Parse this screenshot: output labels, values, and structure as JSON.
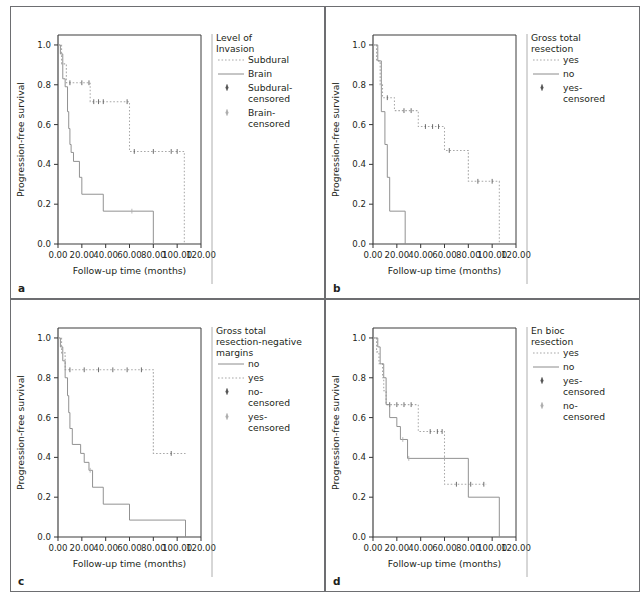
{
  "figure": {
    "panels": [
      "a",
      "b",
      "c",
      "d"
    ],
    "shared": {
      "xlabel": "Follow-up time (months)",
      "ylabel": "Progression-free survival",
      "xticks": [
        "0.00",
        "20.00",
        "40.00",
        "60.00",
        "80.00",
        "100.00",
        "120.00"
      ],
      "yticks": [
        "0.0",
        "0.2",
        "0.4",
        "0.6",
        "0.8",
        "1.0"
      ],
      "xlim": [
        0,
        120
      ],
      "ylim": [
        0,
        1.05
      ]
    }
  },
  "chart_data": [
    {
      "panel": "a",
      "type": "line",
      "title": "",
      "xlabel": "Follow-up time (months)",
      "ylabel": "Progression-free survival",
      "xlim": [
        0,
        120
      ],
      "ylim": [
        0,
        1.05
      ],
      "grid": false,
      "legend_position": "right",
      "legend_title": "Level of Invasion",
      "legend": [
        {
          "label": "Subdural",
          "style": "dotted",
          "color": "#a8a8a8"
        },
        {
          "label": "Brain",
          "style": "solid",
          "color": "#8c8c8c"
        },
        {
          "label": "Subdural-censored",
          "style": "marker",
          "color": "#555555"
        },
        {
          "label": "Brain-censored",
          "style": "marker",
          "color": "#adadad"
        }
      ],
      "series": [
        {
          "name": "Subdural",
          "style": "dotted",
          "steps": [
            [
              0,
              1.0
            ],
            [
              3,
              1.0
            ],
            [
              3,
              0.905
            ],
            [
              7,
              0.905
            ],
            [
              7,
              0.81
            ],
            [
              27,
              0.81
            ],
            [
              27,
              0.715
            ],
            [
              60,
              0.715
            ],
            [
              60,
              0.465
            ],
            [
              106,
              0.465
            ],
            [
              106,
              0.0
            ]
          ],
          "censored": [
            [
              10,
              0.81
            ],
            [
              20,
              0.81
            ],
            [
              26,
              0.81
            ],
            [
              30,
              0.715
            ],
            [
              34,
              0.715
            ],
            [
              38,
              0.715
            ],
            [
              58,
              0.715
            ],
            [
              64,
              0.465
            ],
            [
              80,
              0.465
            ],
            [
              95,
              0.465
            ],
            [
              100,
              0.465
            ]
          ]
        },
        {
          "name": "Brain",
          "style": "solid",
          "steps": [
            [
              0,
              1.0
            ],
            [
              2,
              1.0
            ],
            [
              2,
              0.955
            ],
            [
              4,
              0.955
            ],
            [
              4,
              0.83
            ],
            [
              6,
              0.83
            ],
            [
              6,
              0.79
            ],
            [
              8,
              0.79
            ],
            [
              8,
              0.665
            ],
            [
              9,
              0.665
            ],
            [
              9,
              0.58
            ],
            [
              10,
              0.58
            ],
            [
              10,
              0.5
            ],
            [
              11,
              0.5
            ],
            [
              11,
              0.46
            ],
            [
              13,
              0.46
            ],
            [
              13,
              0.415
            ],
            [
              18,
              0.415
            ],
            [
              18,
              0.335
            ],
            [
              20,
              0.335
            ],
            [
              20,
              0.25
            ],
            [
              38,
              0.25
            ],
            [
              38,
              0.165
            ],
            [
              80,
              0.165
            ],
            [
              80,
              0.0
            ]
          ],
          "censored": [
            [
              62,
              0.165
            ]
          ]
        }
      ]
    },
    {
      "panel": "b",
      "type": "line",
      "title": "",
      "xlabel": "Follow-up time (months)",
      "ylabel": "Progression-free survival",
      "xlim": [
        0,
        120
      ],
      "ylim": [
        0,
        1.05
      ],
      "grid": false,
      "legend_position": "right",
      "legend_title": "Gross total resection",
      "legend": [
        {
          "label": "yes",
          "style": "dotted",
          "color": "#a8a8a8"
        },
        {
          "label": "no",
          "style": "solid",
          "color": "#8c8c8c"
        },
        {
          "label": "yes-censored",
          "style": "marker",
          "color": "#555555"
        }
      ],
      "series": [
        {
          "name": "yes",
          "style": "dotted",
          "steps": [
            [
              0,
              1.0
            ],
            [
              3,
              1.0
            ],
            [
              3,
              0.92
            ],
            [
              6,
              0.92
            ],
            [
              6,
              0.8
            ],
            [
              8,
              0.8
            ],
            [
              8,
              0.735
            ],
            [
              18,
              0.735
            ],
            [
              18,
              0.67
            ],
            [
              38,
              0.67
            ],
            [
              38,
              0.59
            ],
            [
              60,
              0.59
            ],
            [
              60,
              0.47
            ],
            [
              80,
              0.47
            ],
            [
              80,
              0.315
            ],
            [
              106,
              0.315
            ],
            [
              106,
              0.0
            ]
          ],
          "censored": [
            [
              12,
              0.735
            ],
            [
              26,
              0.67
            ],
            [
              32,
              0.67
            ],
            [
              44,
              0.59
            ],
            [
              50,
              0.59
            ],
            [
              55,
              0.59
            ],
            [
              64,
              0.47
            ],
            [
              88,
              0.315
            ],
            [
              100,
              0.315
            ]
          ]
        },
        {
          "name": "no",
          "style": "solid",
          "steps": [
            [
              0,
              1.0
            ],
            [
              4,
              1.0
            ],
            [
              4,
              0.92
            ],
            [
              7,
              0.92
            ],
            [
              7,
              0.665
            ],
            [
              10,
              0.665
            ],
            [
              10,
              0.5
            ],
            [
              12,
              0.5
            ],
            [
              12,
              0.335
            ],
            [
              14,
              0.335
            ],
            [
              14,
              0.165
            ],
            [
              27,
              0.165
            ],
            [
              27,
              0.0
            ]
          ],
          "censored": []
        }
      ]
    },
    {
      "panel": "c",
      "type": "line",
      "title": "",
      "xlabel": "Follow-up time (months)",
      "ylabel": "Progression-free survival",
      "xlim": [
        0,
        120
      ],
      "ylim": [
        0,
        1.05
      ],
      "grid": false,
      "legend_position": "right",
      "legend_title": "Gross total resection-negative margins",
      "legend": [
        {
          "label": "no",
          "style": "solid",
          "color": "#8c8c8c"
        },
        {
          "label": "yes",
          "style": "dotted",
          "color": "#a8a8a8"
        },
        {
          "label": "no-censored",
          "style": "marker",
          "color": "#555555"
        },
        {
          "label": "yes-censored",
          "style": "marker",
          "color": "#adadad"
        }
      ],
      "series": [
        {
          "name": "yes",
          "style": "dotted",
          "steps": [
            [
              0,
              1.0
            ],
            [
              3,
              1.0
            ],
            [
              3,
              0.925
            ],
            [
              6,
              0.925
            ],
            [
              6,
              0.84
            ],
            [
              80,
              0.84
            ],
            [
              80,
              0.42
            ],
            [
              107,
              0.42
            ]
          ],
          "censored": [
            [
              10,
              0.84
            ],
            [
              22,
              0.84
            ],
            [
              34,
              0.84
            ],
            [
              46,
              0.84
            ],
            [
              58,
              0.84
            ],
            [
              70,
              0.84
            ],
            [
              95,
              0.42
            ]
          ]
        },
        {
          "name": "no",
          "style": "solid",
          "steps": [
            [
              0,
              1.0
            ],
            [
              2,
              1.0
            ],
            [
              2,
              0.955
            ],
            [
              4,
              0.955
            ],
            [
              4,
              0.885
            ],
            [
              6,
              0.885
            ],
            [
              6,
              0.8
            ],
            [
              8,
              0.8
            ],
            [
              8,
              0.71
            ],
            [
              9,
              0.71
            ],
            [
              9,
              0.625
            ],
            [
              10,
              0.625
            ],
            [
              10,
              0.545
            ],
            [
              12,
              0.545
            ],
            [
              12,
              0.465
            ],
            [
              19,
              0.465
            ],
            [
              19,
              0.42
            ],
            [
              22,
              0.42
            ],
            [
              22,
              0.375
            ],
            [
              26,
              0.375
            ],
            [
              26,
              0.335
            ],
            [
              29,
              0.335
            ],
            [
              29,
              0.25
            ],
            [
              38,
              0.25
            ],
            [
              38,
              0.165
            ],
            [
              60,
              0.165
            ],
            [
              60,
              0.085
            ],
            [
              107,
              0.085
            ],
            [
              107,
              0.0
            ]
          ],
          "censored": [
            [
              27,
              0.335
            ]
          ]
        }
      ]
    },
    {
      "panel": "d",
      "type": "line",
      "title": "",
      "xlabel": "Follow-up time (months)",
      "ylabel": "Progression-free survival",
      "xlim": [
        0,
        120
      ],
      "ylim": [
        0,
        1.05
      ],
      "grid": false,
      "legend_position": "right",
      "legend_title": "En bioc resection",
      "legend": [
        {
          "label": "yes",
          "style": "dotted",
          "color": "#a8a8a8"
        },
        {
          "label": "no",
          "style": "solid",
          "color": "#8c8c8c"
        },
        {
          "label": "yes-censored",
          "style": "marker",
          "color": "#555555"
        },
        {
          "label": "no-censored",
          "style": "marker",
          "color": "#adadad"
        }
      ],
      "series": [
        {
          "name": "yes",
          "style": "dotted",
          "steps": [
            [
              0,
              1.0
            ],
            [
              3,
              1.0
            ],
            [
              3,
              0.93
            ],
            [
              5,
              0.93
            ],
            [
              5,
              0.87
            ],
            [
              8,
              0.87
            ],
            [
              8,
              0.8
            ],
            [
              9,
              0.8
            ],
            [
              9,
              0.735
            ],
            [
              11,
              0.735
            ],
            [
              11,
              0.665
            ],
            [
              38,
              0.665
            ],
            [
              38,
              0.53
            ],
            [
              60,
              0.53
            ],
            [
              60,
              0.265
            ],
            [
              95,
              0.265
            ]
          ],
          "censored": [
            [
              14,
              0.665
            ],
            [
              20,
              0.665
            ],
            [
              26,
              0.665
            ],
            [
              32,
              0.665
            ],
            [
              48,
              0.53
            ],
            [
              54,
              0.53
            ],
            [
              58,
              0.53
            ],
            [
              70,
              0.265
            ],
            [
              82,
              0.265
            ],
            [
              93,
              0.265
            ]
          ]
        },
        {
          "name": "no",
          "style": "solid",
          "steps": [
            [
              0,
              1.0
            ],
            [
              4,
              1.0
            ],
            [
              4,
              0.955
            ],
            [
              6,
              0.955
            ],
            [
              6,
              0.87
            ],
            [
              9,
              0.87
            ],
            [
              9,
              0.8
            ],
            [
              11,
              0.8
            ],
            [
              11,
              0.665
            ],
            [
              14,
              0.665
            ],
            [
              14,
              0.6
            ],
            [
              20,
              0.6
            ],
            [
              20,
              0.555
            ],
            [
              23,
              0.555
            ],
            [
              23,
              0.49
            ],
            [
              29,
              0.49
            ],
            [
              29,
              0.395
            ],
            [
              80,
              0.395
            ],
            [
              80,
              0.2
            ],
            [
              106,
              0.2
            ],
            [
              106,
              0.0
            ]
          ],
          "censored": [
            [
              25,
              0.49
            ],
            [
              30,
              0.395
            ],
            [
              60,
              0.395
            ]
          ]
        }
      ]
    }
  ]
}
